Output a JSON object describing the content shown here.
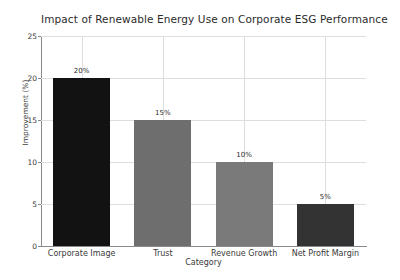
{
  "chart_data": {
    "type": "bar",
    "title": "Impact of Renewable Energy Use on Corporate ESG Performance",
    "xlabel": "Category",
    "ylabel": "Improvement (%)",
    "categories": [
      "Corporate Image",
      "Trust",
      "Revenue Growth",
      "Net Profit Margin"
    ],
    "values": [
      20,
      15,
      10,
      5
    ],
    "data_labels": [
      "20%",
      "15%",
      "10%",
      "5%"
    ],
    "bar_colors": [
      "#121212",
      "#6e6e6e",
      "#7a7a7a",
      "#333333"
    ],
    "ylim": [
      0,
      25
    ],
    "yticks": [
      0,
      5,
      10,
      15,
      20,
      25
    ],
    "ytick_labels": [
      "0",
      "5",
      "10",
      "15",
      "20",
      "25"
    ],
    "grid": true,
    "legend": "none"
  }
}
